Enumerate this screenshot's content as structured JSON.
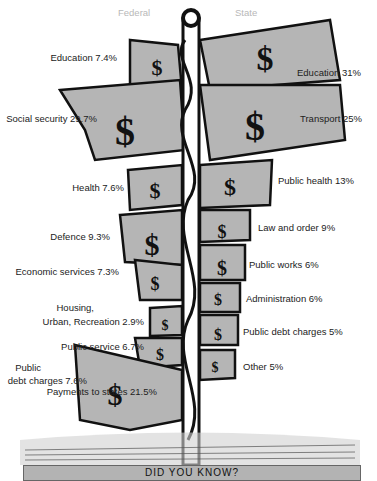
{
  "headers": {
    "federal": "Federal",
    "state": "State"
  },
  "federal": [
    {
      "label": "Education  7.4%"
    },
    {
      "label": "Social security  29.7%"
    },
    {
      "label": "Health  7.6%"
    },
    {
      "label": "Defence  9.3%"
    },
    {
      "label": "Economic services 7.3%"
    },
    {
      "label": "Housing,"
    },
    {
      "label": "Urban, Recreation  2.9%"
    },
    {
      "label": "Public service  6.7%"
    },
    {
      "label": "Public"
    },
    {
      "label": "debt charges 7.6%"
    },
    {
      "label": "Payments to states 21.5%"
    }
  ],
  "state": [
    {
      "label": "Education   31%"
    },
    {
      "label": "Transport   25%"
    },
    {
      "label": "Public health  13%"
    },
    {
      "label": "Law and order  9%"
    },
    {
      "label": "Public works 6%"
    },
    {
      "label": "Administration  6%"
    },
    {
      "label": "Public debt charges  5%"
    },
    {
      "label": "Other  5%"
    }
  ],
  "banner": {
    "text": "DID YOU KNOW?"
  },
  "colors": {
    "flag": "#b5b5b5",
    "ink": "#111111",
    "header": "#b8b8b8"
  }
}
